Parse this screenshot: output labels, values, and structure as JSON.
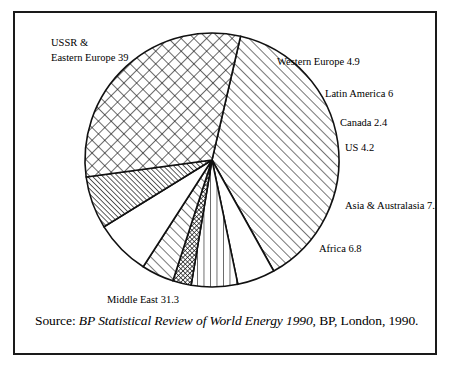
{
  "figure": {
    "border_color": "#1a1a1a",
    "background": "#ffffff"
  },
  "source": {
    "prefix": "Source:",
    "title": "BP Statistical Review of World Energy 1990",
    "suffix": ", BP, London, 1990."
  },
  "chart_data": {
    "type": "pie",
    "title": "",
    "xlabel": "",
    "ylabel": "",
    "total": 101.8,
    "units": "percent share of world oil reserves",
    "start_angle_deg": -77,
    "direction": "clockwise",
    "legend_position": "labels-around-slices",
    "grid": false,
    "categories": [
      "USSR & Eastern Europe",
      "Western Europe",
      "Latin America",
      "Canada",
      "US",
      "Asia & Australasia",
      "Africa",
      "Middle East"
    ],
    "values": [
      39,
      4.9,
      6,
      2.4,
      4.2,
      7.2,
      6.8,
      31.3
    ],
    "slices": [
      {
        "name": "USSR & Eastern Europe",
        "value": 39,
        "value_label": "39",
        "label_line1": "USSR &",
        "label_line2": "Eastern Europe  39",
        "pattern": "diagonal-hatch",
        "label_x": 36,
        "label_y": 33
      },
      {
        "name": "Western Europe",
        "value": 4.9,
        "value_label": "4.9",
        "label_line1": "Western Europe  4.9",
        "label_line2": "",
        "pattern": "blank",
        "label_x": 262,
        "label_y": 52
      },
      {
        "name": "Latin America",
        "value": 6,
        "value_label": "6",
        "label_line1": "Latin America  6",
        "label_line2": "",
        "pattern": "vertical-lines",
        "label_x": 310,
        "label_y": 84
      },
      {
        "name": "Canada",
        "value": 2.4,
        "value_label": "2.4",
        "label_line1": "Canada  2.4",
        "label_line2": "",
        "pattern": "fine-grid",
        "label_x": 325,
        "label_y": 113
      },
      {
        "name": "US",
        "value": 4.2,
        "value_label": "4.2",
        "label_line1": "US  4.2",
        "label_line2": "",
        "pattern": "diagonal-hatch",
        "label_x": 330,
        "label_y": 138
      },
      {
        "name": "Asia & Australasia",
        "value": 7.2,
        "value_label": "7.2",
        "label_line1": "Asia & Australasia  7.2",
        "label_line2": "",
        "pattern": "blank",
        "label_x": 330,
        "label_y": 196
      },
      {
        "name": "Africa",
        "value": 6.8,
        "value_label": "6.8",
        "label_line1": "Africa  6.8",
        "label_line2": "",
        "pattern": "dense-diagonal",
        "label_x": 304,
        "label_y": 239
      },
      {
        "name": "Middle East",
        "value": 31.3,
        "value_label": "31.3",
        "label_line1": "Middle East  31.3",
        "label_line2": "",
        "pattern": "diamond-crosshatch",
        "label_x": 92,
        "label_y": 290
      }
    ]
  }
}
